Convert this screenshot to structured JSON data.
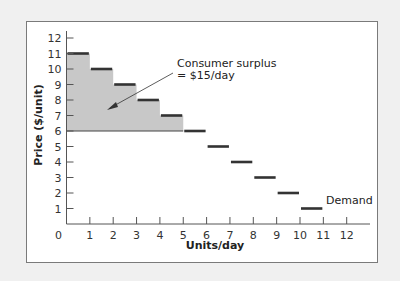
{
  "chart_data": {
    "type": "bar",
    "subtype": "step-demand",
    "title": "",
    "xlabel": "Units/day",
    "ylabel": "Price ($/unit)",
    "xlim": [
      0,
      12
    ],
    "ylim": [
      0,
      12
    ],
    "x_ticks": [
      0,
      1,
      2,
      3,
      4,
      5,
      6,
      7,
      8,
      9,
      10,
      11,
      12
    ],
    "y_ticks": [
      1,
      2,
      3,
      4,
      5,
      6,
      7,
      8,
      9,
      10,
      11,
      12
    ],
    "grid": false,
    "series": [
      {
        "name": "Demand",
        "segments": [
          {
            "x_start": 0,
            "x_end": 1,
            "price": 11
          },
          {
            "x_start": 1,
            "x_end": 2,
            "price": 10
          },
          {
            "x_start": 2,
            "x_end": 3,
            "price": 9
          },
          {
            "x_start": 3,
            "x_end": 4,
            "price": 8
          },
          {
            "x_start": 4,
            "x_end": 5,
            "price": 7
          },
          {
            "x_start": 5,
            "x_end": 6,
            "price": 6
          },
          {
            "x_start": 6,
            "x_end": 7,
            "price": 5
          },
          {
            "x_start": 7,
            "x_end": 8,
            "price": 4
          },
          {
            "x_start": 8,
            "x_end": 9,
            "price": 3
          },
          {
            "x_start": 9,
            "x_end": 10,
            "price": 2
          },
          {
            "x_start": 10,
            "x_end": 11,
            "price": 1
          }
        ]
      }
    ],
    "shaded_region": {
      "name": "Consumer surplus",
      "market_price": 6,
      "x_start": 0,
      "x_end": 5,
      "value": 15,
      "color": "#c8c8c8"
    },
    "annotations": [
      {
        "text": "Consumer surplus",
        "line": 1
      },
      {
        "text": "= $15/day",
        "line": 2
      },
      {
        "text": "Demand",
        "label_for": "series"
      }
    ]
  },
  "labels": {
    "x_axis": "Units/day",
    "y_axis": "Price ($/unit)",
    "cs_line1": "Consumer surplus",
    "cs_line2": "= $15/day",
    "demand": "Demand",
    "origin": "0"
  },
  "colors": {
    "step": "#333333",
    "shade": "#c8c8c8",
    "axis": "#555555"
  }
}
